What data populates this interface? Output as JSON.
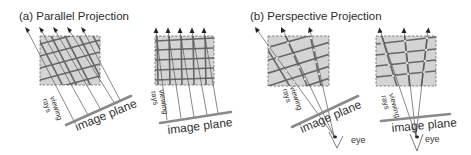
{
  "figure": {
    "panels": [
      {
        "id": "a",
        "title": "(a) Parallel Projection",
        "subfigures": [
          {
            "id": "a-oblique",
            "rays_label_line1": "viewing",
            "rays_label_line2": "rays",
            "plane_label": "image plane",
            "ray_count": 5,
            "projection": "parallel-oblique"
          },
          {
            "id": "a-orthogonal",
            "rays_label_line1": "viewing",
            "rays_label_line2": "rays",
            "plane_label": "image plane",
            "ray_count": 5,
            "projection": "parallel-orthogonal"
          }
        ]
      },
      {
        "id": "b",
        "title": "(b) Perspective Projection",
        "subfigures": [
          {
            "id": "b-oblique",
            "rays_label_line1": "viewing",
            "rays_label_line2": "rays",
            "plane_label": "image plane",
            "eye_label": "eye",
            "ray_count": 3,
            "projection": "perspective-oblique"
          },
          {
            "id": "b-orthogonal",
            "rays_label_line1": "viewing",
            "rays_label_line2": "rays",
            "plane_label": "image plane",
            "eye_label": "eye",
            "ray_count": 3,
            "projection": "perspective-orthogonal"
          }
        ]
      }
    ],
    "colors": {
      "object_fill": "#d4d4d4",
      "grid_line": "#666666",
      "image_plane": "#8a8a8a",
      "ray": "#555555",
      "text": "#333333"
    }
  }
}
